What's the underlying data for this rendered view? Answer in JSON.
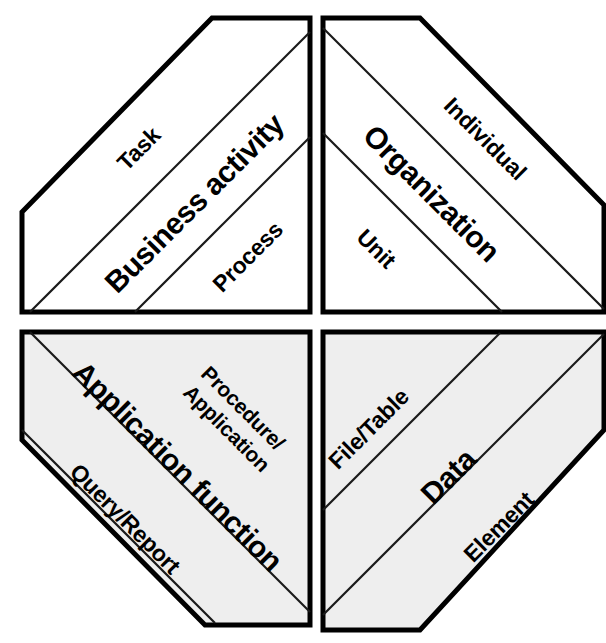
{
  "diagram": {
    "type": "quadrant-framework",
    "title": "",
    "background_color": "#ffffff",
    "outline_color": "#000000",
    "divider_color": "#1a1a1a",
    "quadrants": [
      {
        "id": "business-activity",
        "position": "top-left",
        "fill_color": "#ffffff",
        "main_label": "Business activity",
        "bands": [
          {
            "id": "task",
            "label": "Task",
            "role": "upper"
          },
          {
            "id": "business-activity-main",
            "label": "Business activity",
            "role": "main"
          },
          {
            "id": "process",
            "label": "Process",
            "role": "lower"
          }
        ]
      },
      {
        "id": "organization",
        "position": "top-right",
        "fill_color": "#ffffff",
        "main_label": "Organization",
        "bands": [
          {
            "id": "individual",
            "label": "Individual",
            "role": "upper"
          },
          {
            "id": "organization-main",
            "label": "Organization",
            "role": "main"
          },
          {
            "id": "unit",
            "label": "Unit",
            "role": "lower"
          }
        ]
      },
      {
        "id": "application-function",
        "position": "bottom-left",
        "fill_color": "#eeeeee",
        "main_label": "Application function",
        "bands": [
          {
            "id": "procedure-application",
            "label": "Procedure/ Application",
            "label_line1": "Procedure/",
            "label_line2": "Application",
            "role": "upper"
          },
          {
            "id": "application-function-main",
            "label": "Application function",
            "role": "main"
          },
          {
            "id": "query-report",
            "label": "Query/Report",
            "role": "lower"
          }
        ]
      },
      {
        "id": "data",
        "position": "bottom-right",
        "fill_color": "#eeeeee",
        "main_label": "Data",
        "bands": [
          {
            "id": "file-table",
            "label": "File/Table",
            "role": "upper"
          },
          {
            "id": "data-main",
            "label": "Data",
            "role": "main"
          },
          {
            "id": "element",
            "label": "Element",
            "role": "lower"
          }
        ]
      }
    ]
  }
}
